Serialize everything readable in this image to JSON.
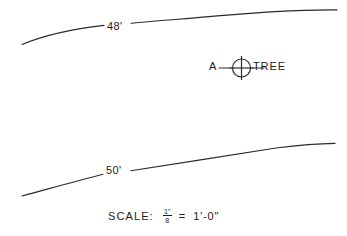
{
  "drawing": {
    "type": "site-plan-contour-detail",
    "background_color": "#ffffff",
    "ink_color": "#2b2b2b"
  },
  "contours": [
    {
      "id": "contour-48",
      "label": "48'",
      "elevation": 48,
      "unit": "feet"
    },
    {
      "id": "contour-50",
      "label": "50'",
      "elevation": 50,
      "unit": "feet"
    }
  ],
  "tree_marker": {
    "designation": "A",
    "label": "TREE",
    "symbol": "circle-with-cross-icon"
  },
  "scale_note": {
    "word": "SCALE:",
    "numerator": "1\"",
    "denominator": "8",
    "equals": "=",
    "value": "1'-0\"",
    "full_text": "SCALE:  1\"/8 = 1'-0\""
  }
}
